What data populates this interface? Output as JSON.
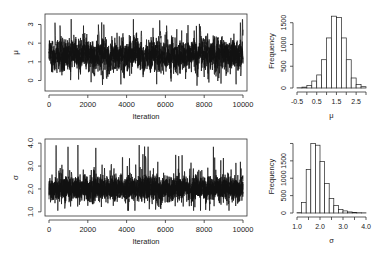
{
  "chart_data": [
    {
      "type": "line",
      "title": "",
      "xlabel": "Iteration",
      "ylabel": "μ",
      "xlim": [
        0,
        10000
      ],
      "ylim": [
        -0.4,
        3.4
      ],
      "xticks": [
        "0",
        "2000",
        "4000",
        "6000",
        "8000",
        "10000"
      ],
      "xtick_values": [
        0,
        2000,
        4000,
        6000,
        8000,
        10000
      ],
      "yticks": [
        "0",
        "1",
        "2",
        "3"
      ],
      "ytick_values": [
        0,
        1,
        2,
        3
      ],
      "grid": false,
      "description": "MCMC trace plot of μ over 10000 iterations; values fluctuate around ~1.3, mostly between 0.2 and 2.5, with spikes up to ~3.3 and dips to ~-0.3",
      "center": 1.35,
      "spread": 0.45,
      "min": -0.3,
      "max": 3.3
    },
    {
      "type": "bar",
      "title": "",
      "xlabel": "μ",
      "ylabel": "Frequency",
      "xlim": [
        -0.5,
        3.0
      ],
      "ylim": [
        0,
        1700
      ],
      "xticks": [
        "-0.5",
        "0.5",
        "1.5",
        "2.5"
      ],
      "xtick_values": [
        -0.5,
        0.5,
        1.5,
        2.5
      ],
      "yticks": [
        "0",
        "500",
        "1000",
        "1500"
      ],
      "ytick_values": [
        0,
        500,
        1000,
        1500
      ],
      "bin_edges": [
        -0.5,
        -0.25,
        0.0,
        0.25,
        0.5,
        0.75,
        1.0,
        1.25,
        1.5,
        1.75,
        2.0,
        2.25,
        2.5,
        2.75,
        3.0
      ],
      "values": [
        5,
        20,
        60,
        160,
        300,
        650,
        1150,
        1650,
        1620,
        1150,
        650,
        230,
        80,
        30
      ],
      "grid": false
    },
    {
      "type": "line",
      "title": "",
      "xlabel": "Iteration",
      "ylabel": "σ",
      "xlim": [
        0,
        10000
      ],
      "ylim": [
        0.95,
        4.05
      ],
      "xticks": [
        "0",
        "2000",
        "4000",
        "6000",
        "8000",
        "10000"
      ],
      "xtick_values": [
        0,
        2000,
        4000,
        6000,
        8000,
        10000
      ],
      "yticks": [
        "1.0",
        "2.0",
        "3.0",
        "4.0"
      ],
      "ytick_values": [
        1.0,
        2.0,
        3.0,
        4.0
      ],
      "grid": false,
      "description": "MCMC trace plot of σ over 10000 iterations; values fluctuate around ~1.9, mostly between 1.3 and 2.8, with spikes up to ~3.9",
      "center": 1.9,
      "spread": 0.35,
      "min": 1.05,
      "max": 3.95
    },
    {
      "type": "bar",
      "title": "",
      "xlabel": "σ",
      "ylabel": "Frequency",
      "xlim": [
        1.0,
        4.0
      ],
      "ylim": [
        0,
        2100
      ],
      "xticks": [
        "1.0",
        "2.0",
        "3.0",
        "4.0"
      ],
      "xtick_values": [
        1.0,
        2.0,
        3.0,
        4.0
      ],
      "yticks": [
        "0",
        "500",
        "1000",
        "1500"
      ],
      "ytick_values": [
        0,
        500,
        1000,
        1500
      ],
      "bin_edges": [
        1.0,
        1.2,
        1.4,
        1.6,
        1.8,
        2.0,
        2.2,
        2.4,
        2.6,
        2.8,
        3.0,
        3.2,
        3.4,
        3.6,
        3.8,
        4.0
      ],
      "values": [
        10,
        300,
        1250,
        2000,
        1950,
        1480,
        850,
        420,
        220,
        100,
        60,
        30,
        15,
        8,
        5
      ],
      "grid": false
    }
  ]
}
